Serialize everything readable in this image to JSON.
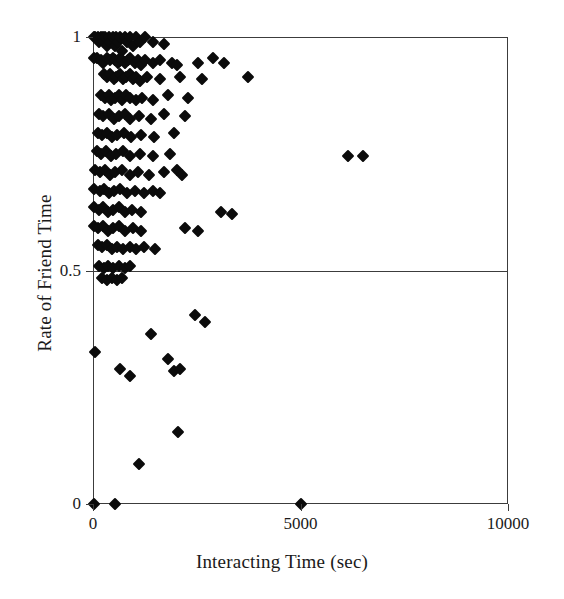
{
  "chart_data": {
    "type": "scatter",
    "title": "",
    "xlabel": "Interacting Time (sec)",
    "ylabel": "Rate of Friend Time",
    "xlim": [
      0,
      10000
    ],
    "ylim": [
      0,
      1
    ],
    "xticks": [
      0,
      5000,
      10000
    ],
    "xticklabels": [
      "0",
      "5000",
      "10000"
    ],
    "yticks": [
      0,
      0.5,
      1
    ],
    "yticklabels": [
      "0",
      "0.5",
      "1"
    ],
    "grid": false,
    "legend": null,
    "marker": "diamond",
    "marker_color": "#0b0b0b",
    "reference_lines": [
      {
        "orientation": "horizontal",
        "value": 0.5,
        "color": "#3c3c3c"
      }
    ],
    "points": [
      [
        20,
        1.0
      ],
      [
        60,
        1.0
      ],
      [
        110,
        1.0
      ],
      [
        150,
        0.99
      ],
      [
        190,
        1.0
      ],
      [
        230,
        1.0
      ],
      [
        270,
        0.99
      ],
      [
        300,
        1.0
      ],
      [
        340,
        0.98
      ],
      [
        380,
        1.0
      ],
      [
        420,
        0.99
      ],
      [
        470,
        1.0
      ],
      [
        520,
        0.98
      ],
      [
        560,
        1.0
      ],
      [
        610,
        0.99
      ],
      [
        660,
        1.0
      ],
      [
        700,
        0.97
      ],
      [
        760,
        1.0
      ],
      [
        820,
        0.99
      ],
      [
        880,
        1.0
      ],
      [
        960,
        0.98
      ],
      [
        1040,
        1.0
      ],
      [
        1130,
        0.99
      ],
      [
        1260,
        1.0
      ],
      [
        1440,
        0.99
      ],
      [
        1720,
        0.985
      ],
      [
        20,
        0.955
      ],
      [
        90,
        0.955
      ],
      [
        200,
        0.95
      ],
      [
        250,
        0.945
      ],
      [
        330,
        0.955
      ],
      [
        400,
        0.95
      ],
      [
        480,
        0.955
      ],
      [
        540,
        0.95
      ],
      [
        600,
        0.945
      ],
      [
        640,
        0.955
      ],
      [
        700,
        0.95
      ],
      [
        760,
        0.945
      ],
      [
        840,
        0.95
      ],
      [
        900,
        0.955
      ],
      [
        1000,
        0.945
      ],
      [
        1080,
        0.95
      ],
      [
        1150,
        0.94
      ],
      [
        1260,
        0.95
      ],
      [
        1450,
        0.945
      ],
      [
        1620,
        0.95
      ],
      [
        1900,
        0.945
      ],
      [
        2030,
        0.94
      ],
      [
        2530,
        0.945
      ],
      [
        2880,
        0.955
      ],
      [
        3150,
        0.945
      ],
      [
        260,
        0.92
      ],
      [
        330,
        0.915
      ],
      [
        420,
        0.92
      ],
      [
        500,
        0.91
      ],
      [
        560,
        0.915
      ],
      [
        640,
        0.92
      ],
      [
        720,
        0.91
      ],
      [
        800,
        0.915
      ],
      [
        880,
        0.92
      ],
      [
        960,
        0.91
      ],
      [
        1040,
        0.915
      ],
      [
        1130,
        0.905
      ],
      [
        1290,
        0.915
      ],
      [
        1620,
        0.91
      ],
      [
        2090,
        0.915
      ],
      [
        2620,
        0.91
      ],
      [
        3740,
        0.915
      ],
      [
        200,
        0.875
      ],
      [
        290,
        0.87
      ],
      [
        380,
        0.875
      ],
      [
        440,
        0.865
      ],
      [
        520,
        0.87
      ],
      [
        620,
        0.875
      ],
      [
        700,
        0.865
      ],
      [
        800,
        0.875
      ],
      [
        900,
        0.87
      ],
      [
        1040,
        0.865
      ],
      [
        1180,
        0.87
      ],
      [
        1450,
        0.865
      ],
      [
        1810,
        0.875
      ],
      [
        2300,
        0.87
      ],
      [
        150,
        0.835
      ],
      [
        250,
        0.83
      ],
      [
        380,
        0.835
      ],
      [
        500,
        0.825
      ],
      [
        620,
        0.83
      ],
      [
        760,
        0.835
      ],
      [
        900,
        0.825
      ],
      [
        1110,
        0.83
      ],
      [
        1390,
        0.825
      ],
      [
        1720,
        0.835
      ],
      [
        2220,
        0.83
      ],
      [
        120,
        0.795
      ],
      [
        220,
        0.79
      ],
      [
        330,
        0.795
      ],
      [
        460,
        0.785
      ],
      [
        580,
        0.79
      ],
      [
        740,
        0.795
      ],
      [
        920,
        0.785
      ],
      [
        1150,
        0.79
      ],
      [
        1480,
        0.785
      ],
      [
        1950,
        0.795
      ],
      [
        90,
        0.755
      ],
      [
        200,
        0.75
      ],
      [
        310,
        0.755
      ],
      [
        430,
        0.745
      ],
      [
        560,
        0.75
      ],
      [
        720,
        0.755
      ],
      [
        890,
        0.745
      ],
      [
        1130,
        0.75
      ],
      [
        1450,
        0.745
      ],
      [
        1850,
        0.75
      ],
      [
        6150,
        0.745
      ],
      [
        6500,
        0.745
      ],
      [
        60,
        0.715
      ],
      [
        180,
        0.71
      ],
      [
        290,
        0.715
      ],
      [
        400,
        0.705
      ],
      [
        540,
        0.71
      ],
      [
        700,
        0.715
      ],
      [
        880,
        0.705
      ],
      [
        1080,
        0.71
      ],
      [
        1340,
        0.705
      ],
      [
        1720,
        0.71
      ],
      [
        2030,
        0.715
      ],
      [
        2150,
        0.705
      ],
      [
        30,
        0.675
      ],
      [
        160,
        0.67
      ],
      [
        270,
        0.675
      ],
      [
        380,
        0.665
      ],
      [
        500,
        0.67
      ],
      [
        660,
        0.675
      ],
      [
        820,
        0.665
      ],
      [
        1000,
        0.67
      ],
      [
        1240,
        0.665
      ],
      [
        1450,
        0.67
      ],
      [
        1620,
        0.665
      ],
      [
        30,
        0.635
      ],
      [
        140,
        0.63
      ],
      [
        250,
        0.635
      ],
      [
        360,
        0.625
      ],
      [
        470,
        0.63
      ],
      [
        620,
        0.635
      ],
      [
        780,
        0.625
      ],
      [
        940,
        0.63
      ],
      [
        1150,
        0.625
      ],
      [
        3080,
        0.625
      ],
      [
        3350,
        0.62
      ],
      [
        20,
        0.595
      ],
      [
        130,
        0.59
      ],
      [
        240,
        0.595
      ],
      [
        350,
        0.585
      ],
      [
        470,
        0.59
      ],
      [
        620,
        0.595
      ],
      [
        780,
        0.585
      ],
      [
        960,
        0.59
      ],
      [
        1160,
        0.585
      ],
      [
        2220,
        0.59
      ],
      [
        2530,
        0.585
      ],
      [
        110,
        0.555
      ],
      [
        220,
        0.55
      ],
      [
        330,
        0.555
      ],
      [
        450,
        0.545
      ],
      [
        580,
        0.55
      ],
      [
        720,
        0.545
      ],
      [
        880,
        0.55
      ],
      [
        1040,
        0.545
      ],
      [
        1240,
        0.55
      ],
      [
        1500,
        0.545
      ],
      [
        150,
        0.51
      ],
      [
        260,
        0.505
      ],
      [
        370,
        0.51
      ],
      [
        490,
        0.505
      ],
      [
        620,
        0.51
      ],
      [
        760,
        0.505
      ],
      [
        900,
        0.51
      ],
      [
        220,
        0.485
      ],
      [
        330,
        0.48
      ],
      [
        450,
        0.485
      ],
      [
        570,
        0.48
      ],
      [
        700,
        0.485
      ],
      [
        60,
        0.325
      ],
      [
        640,
        0.29
      ],
      [
        880,
        0.275
      ],
      [
        1400,
        0.365
      ],
      [
        1800,
        0.31
      ],
      [
        1950,
        0.285
      ],
      [
        2100,
        0.29
      ],
      [
        2450,
        0.405
      ],
      [
        2700,
        0.39
      ],
      [
        2050,
        0.155
      ],
      [
        1100,
        0.085
      ],
      [
        30,
        0.0
      ],
      [
        520,
        0.0
      ],
      [
        5000,
        0.0
      ]
    ]
  },
  "axis_titles": {
    "x": "Interacting Time (sec)",
    "y": "Rate of Friend Time"
  }
}
